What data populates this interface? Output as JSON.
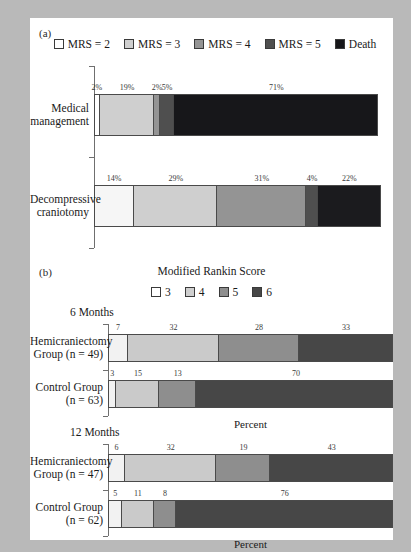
{
  "figure": {
    "panel_a_letter": "(a)",
    "panel_b_letter": "(b)",
    "panel_b_title": "Modified Rankin Score",
    "axis_caption": "Percent"
  },
  "legend_a": {
    "items": [
      {
        "label": "MRS = 2",
        "color": "#ffffff"
      },
      {
        "label": "MRS = 3",
        "color": "#cfcfcf"
      },
      {
        "label": "MRS = 4",
        "color": "#949494"
      },
      {
        "label": "MRS = 5",
        "color": "#4f4f4f"
      },
      {
        "label": "Death",
        "color": "#17171a"
      }
    ]
  },
  "legend_b": {
    "items": [
      {
        "label": "3",
        "color": "#ffffff"
      },
      {
        "label": "4",
        "color": "#cfcfcf"
      },
      {
        "label": "5",
        "color": "#8e8e8e"
      },
      {
        "label": "6",
        "color": "#474747"
      }
    ]
  },
  "chart_data": [
    {
      "type": "bar",
      "orientation": "horizontal",
      "stacked": true,
      "title": "(a)",
      "xlabel": "",
      "ylabel": "",
      "xlim": [
        0,
        100
      ],
      "grid": false,
      "legend_position": "top",
      "value_suffix": "%",
      "categories": [
        "Medical management",
        "Decompressive craniotomy"
      ],
      "series": [
        {
          "name": "MRS = 2",
          "color": "#ffffff",
          "values": [
            2,
            14
          ]
        },
        {
          "name": "MRS = 3",
          "color": "#cfcfcf",
          "values": [
            19,
            29
          ]
        },
        {
          "name": "MRS = 4",
          "color": "#949494",
          "values": [
            2,
            31
          ]
        },
        {
          "name": "MRS = 5",
          "color": "#4f4f4f",
          "values": [
            5,
            4
          ]
        },
        {
          "name": "Death",
          "color": "#17171a",
          "values": [
            71,
            22
          ]
        }
      ]
    },
    {
      "type": "bar",
      "orientation": "horizontal",
      "stacked": true,
      "title": "6 Months",
      "xlabel": "Percent",
      "ylabel": "",
      "xlim": [
        0,
        100
      ],
      "grid": false,
      "legend_position": "top",
      "categories": [
        "Hemicraniectomy Group (n = 49)",
        "Control Group (n = 63)"
      ],
      "series": [
        {
          "name": "3",
          "color": "#f2f2f2",
          "values": [
            7,
            3
          ]
        },
        {
          "name": "4",
          "color": "#cacaca",
          "values": [
            32,
            15
          ]
        },
        {
          "name": "5",
          "color": "#8e8e8e",
          "values": [
            28,
            13
          ]
        },
        {
          "name": "6",
          "color": "#474747",
          "values": [
            33,
            70
          ]
        }
      ]
    },
    {
      "type": "bar",
      "orientation": "horizontal",
      "stacked": true,
      "title": "12 Months",
      "xlabel": "Percent",
      "ylabel": "",
      "xlim": [
        0,
        100
      ],
      "grid": false,
      "legend_position": "top",
      "categories": [
        "Hemicraniectomy Group (n = 47)",
        "Control Group (n = 62)"
      ],
      "series": [
        {
          "name": "3",
          "color": "#f2f2f2",
          "values": [
            6,
            5
          ]
        },
        {
          "name": "4",
          "color": "#cacaca",
          "values": [
            32,
            11
          ]
        },
        {
          "name": "5",
          "color": "#8e8e8e",
          "values": [
            19,
            8
          ]
        },
        {
          "name": "6",
          "color": "#474747",
          "values": [
            43,
            76
          ]
        }
      ]
    }
  ],
  "panel_a": {
    "bars": [
      {
        "label_line1": "Medical",
        "label_line2": "management",
        "segments": [
          {
            "value": 2,
            "text": "2%",
            "color": "#ffffff"
          },
          {
            "value": 19,
            "text": "19%",
            "color": "#cfcfcf"
          },
          {
            "value": 2,
            "text": "2%",
            "color": "#949494"
          },
          {
            "value": 5,
            "text": "5%",
            "color": "#4f4f4f"
          },
          {
            "value": 71,
            "text": "71%",
            "color": "#17171a"
          }
        ]
      },
      {
        "label_line1": "Decompressive",
        "label_line2": "craniotomy",
        "segments": [
          {
            "value": 14,
            "text": "14%",
            "color": "#f6f6f6"
          },
          {
            "value": 29,
            "text": "29%",
            "color": "#cfcfcf"
          },
          {
            "value": 31,
            "text": "31%",
            "color": "#949494"
          },
          {
            "value": 4,
            "text": "4%",
            "color": "#4f4f4f"
          },
          {
            "value": 22,
            "text": "22%",
            "color": "#1b1b1e"
          }
        ]
      }
    ]
  },
  "panel_b": {
    "groups": [
      {
        "heading": "6 Months",
        "caption": "Percent",
        "bars": [
          {
            "label_line1": "Hemicraniectomy",
            "label_line2": "Group (n = 49)",
            "segments": [
              {
                "value": 7,
                "text": "7",
                "color": "#f2f2f2"
              },
              {
                "value": 32,
                "text": "32",
                "color": "#cacaca"
              },
              {
                "value": 28,
                "text": "28",
                "color": "#8e8e8e"
              },
              {
                "value": 33,
                "text": "33",
                "color": "#474747"
              }
            ]
          },
          {
            "label_line1": "Control Group",
            "label_line2": "(n = 63)",
            "segments": [
              {
                "value": 3,
                "text": "3",
                "color": "#f2f2f2"
              },
              {
                "value": 15,
                "text": "15",
                "color": "#cacaca"
              },
              {
                "value": 13,
                "text": "13",
                "color": "#8e8e8e"
              },
              {
                "value": 70,
                "text": "70",
                "color": "#474747"
              }
            ]
          }
        ]
      },
      {
        "heading": "12 Months",
        "caption": "Percent",
        "bars": [
          {
            "label_line1": "Hemicraniectomy",
            "label_line2": "Group (n = 47)",
            "segments": [
              {
                "value": 6,
                "text": "6",
                "color": "#f2f2f2"
              },
              {
                "value": 32,
                "text": "32",
                "color": "#cacaca"
              },
              {
                "value": 19,
                "text": "19",
                "color": "#8e8e8e"
              },
              {
                "value": 43,
                "text": "43",
                "color": "#474747"
              }
            ]
          },
          {
            "label_line1": "Control Group",
            "label_line2": "(n = 62)",
            "segments": [
              {
                "value": 5,
                "text": "5",
                "color": "#f2f2f2"
              },
              {
                "value": 11,
                "text": "11",
                "color": "#cacaca"
              },
              {
                "value": 8,
                "text": "8",
                "color": "#8e8e8e"
              },
              {
                "value": 76,
                "text": "76",
                "color": "#474747"
              }
            ]
          }
        ]
      }
    ]
  }
}
